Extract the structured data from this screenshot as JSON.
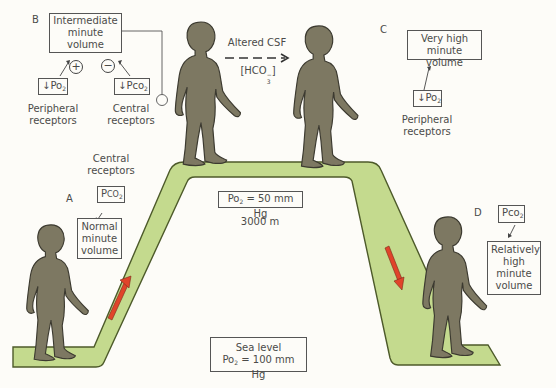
{
  "panels": {
    "A": {
      "letter": "A",
      "receptor_label_line1": "Central",
      "receptor_label_line2": "receptors",
      "stimulus": "PCO2",
      "stimulus_prefix": "P",
      "stimulus_main": "CO",
      "stimulus_sub": "2",
      "response_line1": "Normal",
      "response_line2": "minute",
      "response_line3": "volume"
    },
    "B": {
      "letter": "B",
      "response_line1": "Intermediate",
      "response_line2": "minute",
      "response_line3": "volume",
      "left_stimulus_arrow": "↓",
      "left_stimulus_main": "Po",
      "left_stimulus_sub": "2",
      "left_sign": "+",
      "left_receptor_line1": "Peripheral",
      "left_receptor_line2": "receptors",
      "right_stimulus_arrow": "↓",
      "right_stimulus_main": "Pco",
      "right_stimulus_sub": "2",
      "right_sign": "−",
      "right_receptor_line1": "Central",
      "right_receptor_line2": "receptors"
    },
    "C": {
      "letter": "C",
      "response_line1": "Very high",
      "response_line2": "minute volume",
      "stimulus_arrow": "↓",
      "stimulus_main": "Po",
      "stimulus_sub": "2",
      "receptor_line1": "Peripheral",
      "receptor_line2": "receptors"
    },
    "D": {
      "letter": "D",
      "stimulus_main": "Pco",
      "stimulus_sub": "2",
      "response_line1": "Relatively",
      "response_line2": "high",
      "response_line3": "minute",
      "response_line4": "volume"
    }
  },
  "transition": {
    "label": "Altered CSF",
    "sublabel_main": "[HCO",
    "sublabel_sub": "3",
    "sublabel_sup": "−",
    "sublabel_end": "]"
  },
  "altitude": {
    "po2_main": "Po",
    "po2_sub": "2",
    "po2_value": " = 50 mm Hg",
    "height": "3000 m"
  },
  "sea_level": {
    "line1": "Sea level",
    "po2_main": "Po",
    "po2_sub": "2",
    "po2_value": " = 100 mm Hg"
  },
  "colors": {
    "ramp_fill": "#c4da8e",
    "ramp_stroke": "#4d5a2a",
    "figure": "#7d7862",
    "figure_outline": "#3c3a30",
    "arrow_red": "#e0442a",
    "background": "#fdfcf8"
  }
}
